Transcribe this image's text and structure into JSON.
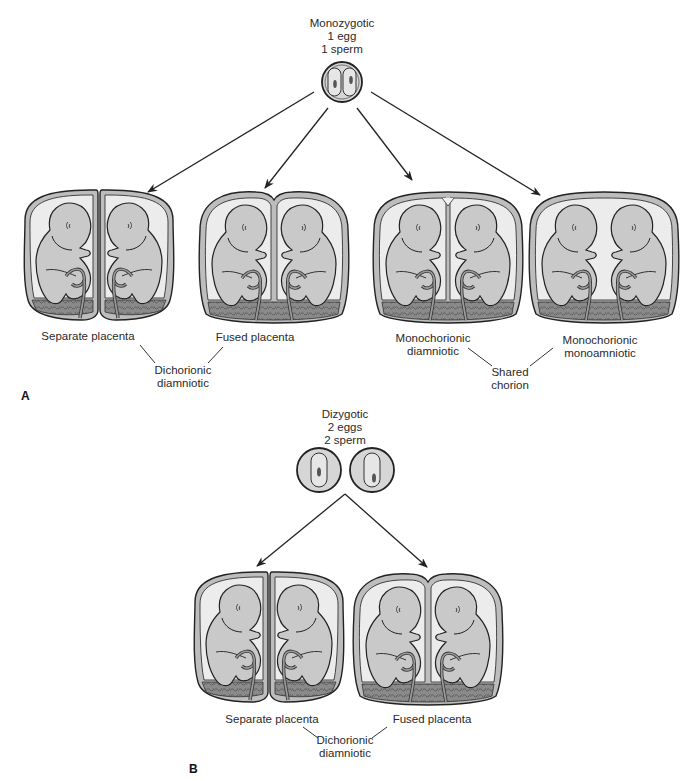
{
  "panel_a": {
    "letter": "A",
    "zygote_label": [
      "Monozygotic",
      "1 egg",
      "1 sperm"
    ],
    "twins": [
      {
        "id": "separate",
        "label": [
          "Separate placenta"
        ]
      },
      {
        "id": "fused",
        "label": [
          "Fused placenta"
        ]
      },
      {
        "id": "mono-di",
        "label": [
          "Monochorionic",
          "diamniotic"
        ]
      },
      {
        "id": "mono-mono",
        "label": [
          "Monochorionic",
          "monoamniotic"
        ]
      }
    ],
    "group_labels": [
      {
        "text": [
          "Dichorionic",
          "diamniotic"
        ]
      },
      {
        "text": [
          "Shared",
          "chorion"
        ]
      }
    ]
  },
  "panel_b": {
    "letter": "B",
    "zygote_label": [
      "Dizygotic",
      "2 eggs",
      "2 sperm"
    ],
    "twins": [
      {
        "id": "separate",
        "label": [
          "Separate placenta"
        ]
      },
      {
        "id": "fused",
        "label": [
          "Fused placenta"
        ]
      }
    ],
    "group_labels": [
      {
        "text": [
          "Dichorionic",
          "diamniotic"
        ]
      }
    ]
  },
  "caption": "FIGURE 7-5 (A) Monozygotic twins (B) Dizygotic twins",
  "colors": {
    "outline": "#2b2b2b",
    "membrane_fill": "#bdbdbd",
    "amnion_space": "#ececec",
    "fetus_fill": "#c9c9c9",
    "placenta_fill": "#8f8f8f",
    "zygote_fill": "#d6d6d6"
  }
}
